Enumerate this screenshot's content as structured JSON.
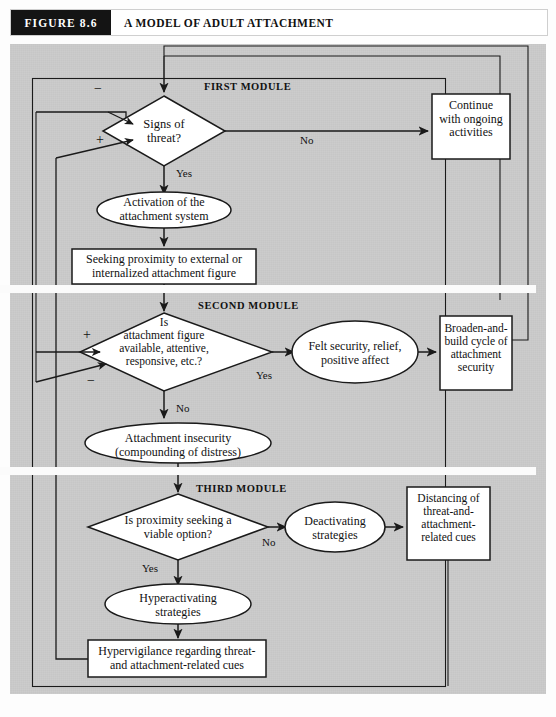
{
  "figure": {
    "tag": "FIGURE  8.6",
    "title": "A MODEL OF ADULT ATTACHMENT"
  },
  "colors": {
    "panel_background": "#c9c9c9",
    "node_fill": "#ffffff",
    "stroke": "#1a1a1a",
    "caption_tag_background": "#141414",
    "caption_tag_text": "#ffffff",
    "separator": "#fbfbfb"
  },
  "modules": [
    {
      "id": "first",
      "label": "FIRST MODULE"
    },
    {
      "id": "second",
      "label": "SECOND MODULE"
    },
    {
      "id": "third",
      "label": "THIRD MODULE"
    }
  ],
  "nodes": {
    "signs_of_threat": {
      "shape": "diamond",
      "text": "Signs of\nthreat?"
    },
    "continue_activities": {
      "shape": "rect",
      "text": "Continue\nwith ongoing\nactivities"
    },
    "activation": {
      "shape": "ellipse",
      "text": "Activation of the\nattachment system"
    },
    "seeking_proximity": {
      "shape": "rect",
      "text": "Seeking proximity to external or\ninternalized attachment figure"
    },
    "figure_available": {
      "shape": "diamond",
      "text": "Is\nattachment figure\navailable, attentive,\nresponsive, etc.?"
    },
    "felt_security": {
      "shape": "ellipse",
      "text": "Felt security, relief,\npositive affect"
    },
    "broaden_and_build": {
      "shape": "rect",
      "text": "Broaden-and-\nbuild cycle of\nattachment\nsecurity"
    },
    "attachment_insecurity": {
      "shape": "ellipse",
      "text": "Attachment insecurity\n(compounding of distress)"
    },
    "proximity_viable": {
      "shape": "diamond",
      "text": "Is proximity seeking a\nviable option?"
    },
    "deactivating": {
      "shape": "ellipse",
      "text": "Deactivating\nstrategies"
    },
    "distancing": {
      "shape": "rect",
      "text": "Distancing of\nthreat-and-\nattachment-\nrelated cues"
    },
    "hyperactivating": {
      "shape": "ellipse",
      "text": "Hyperactivating\nstrategies"
    },
    "hypervigilance": {
      "shape": "rect",
      "text": "Hypervigilance regarding threat-\nand attachment-related cues"
    }
  },
  "edge_labels": {
    "threat_no": "No",
    "threat_yes": "Yes",
    "available_yes": "Yes",
    "available_no": "No",
    "viable_no": "No",
    "viable_yes": "Yes"
  },
  "sign_labels": {
    "threat_minus": "−",
    "threat_plus": "+",
    "available_plus": "+",
    "available_minus": "−"
  }
}
